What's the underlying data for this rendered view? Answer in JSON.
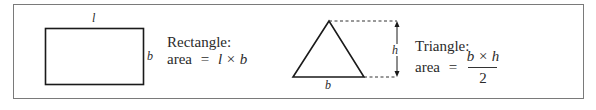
{
  "rectangle": {
    "label_top": "l",
    "label_right": "b",
    "title": "Rectangle:",
    "area_label": "area",
    "equals": "=",
    "formula": "l × b"
  },
  "triangle": {
    "label_height": "h",
    "label_base": "b",
    "title": "Triangle:",
    "area_label": "area",
    "equals": "=",
    "numerator": "b × h",
    "denominator": "2"
  },
  "colors": {
    "stroke": "#1a1a1a",
    "frame": "#7a7a7a",
    "text": "#2a2a2a"
  }
}
